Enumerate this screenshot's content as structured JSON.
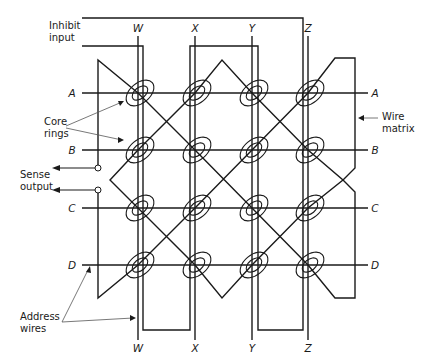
{
  "figure": {
    "labels": {
      "inhibit": [
        "Inhibit",
        "input"
      ],
      "core_rings": [
        "Core",
        "rings"
      ],
      "sense": [
        "Sense",
        "output"
      ],
      "wire_matrix": [
        "Wire",
        "matrix"
      ],
      "address_wires": [
        "Address",
        "wires"
      ]
    },
    "columns": [
      "W",
      "X",
      "Y",
      "Z"
    ],
    "rows": [
      "A",
      "B",
      "C",
      "D"
    ],
    "grid": {
      "core_count": 16,
      "layout": "4x4"
    },
    "colors": {
      "ink": "#1a1a1a",
      "background": "#ffffff"
    }
  }
}
